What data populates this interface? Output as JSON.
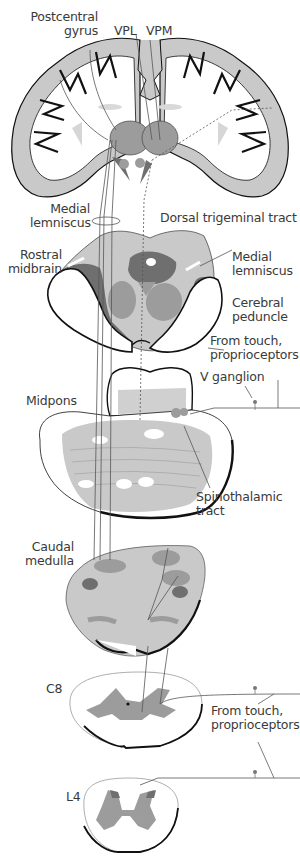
{
  "figure": {
    "colors": {
      "gray_light": "#c9c9c9",
      "gray_mid": "#9c9c9c",
      "gray_dark": "#6f6f6f",
      "outline": "#111111",
      "line": "#555555",
      "background": "#ffffff"
    }
  },
  "labels": {
    "postcentral_gyrus": [
      "Postcentral",
      "gyrus"
    ],
    "vpl": "VPL",
    "vpm": "VPM",
    "medial_lemniscus_top": [
      "Medial",
      "lemniscus"
    ],
    "dorsal_trigeminal_tract": "Dorsal trigeminal tract",
    "rostral_midbrain": [
      "Rostral",
      "midbrain"
    ],
    "medial_lemniscus_mid": [
      "Medial",
      "lemniscus"
    ],
    "cerebral_peduncle": [
      "Cerebral",
      "peduncle"
    ],
    "from_touch_top": [
      "From touch,",
      "proprioceptors"
    ],
    "v_ganglion": "V ganglion",
    "midpons": "Midpons",
    "spinothalamic_tract": [
      "Spinothalamic",
      "tract"
    ],
    "caudal_medulla": [
      "Caudal",
      "medulla"
    ],
    "c8": "C8",
    "from_touch_bottom": [
      "From touch,",
      "proprioceptors"
    ],
    "l4": "L4"
  },
  "sections": [
    {
      "name": "Coronal section of cerebrum",
      "level": "cortex/thalamus"
    },
    {
      "name": "Rostral midbrain",
      "level": "midbrain"
    },
    {
      "name": "Midpons",
      "level": "pons"
    },
    {
      "name": "Caudal medulla",
      "level": "medulla"
    },
    {
      "name": "C8",
      "level": "cervical spinal cord"
    },
    {
      "name": "L4",
      "level": "lumbar spinal cord"
    }
  ]
}
